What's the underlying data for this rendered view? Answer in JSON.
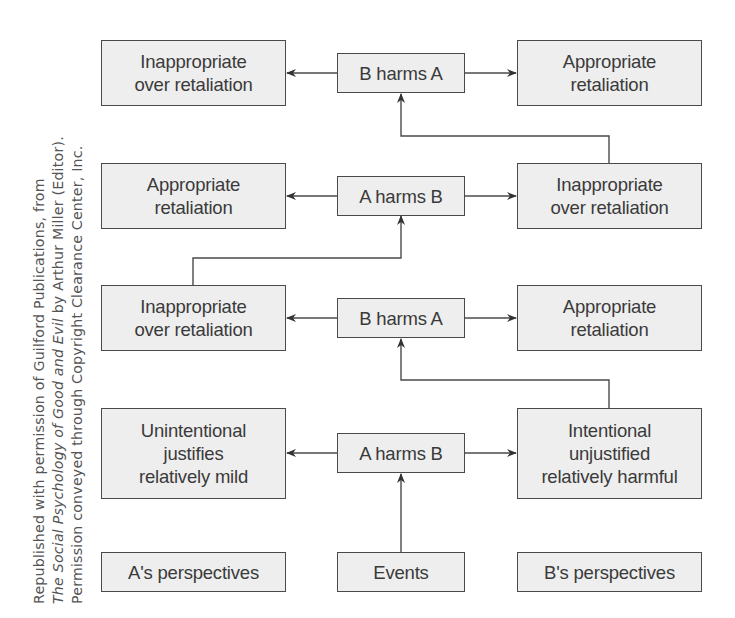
{
  "credit": {
    "line1": "Republished with permission of Guilford Publications, from",
    "line2_italic": "The Social Psychology of Good and Evil",
    "line2_rest": " by Arthur Miller (Editor).",
    "line3": "Permission conveyed through Copyright Clearance Center, Inc."
  },
  "rows": [
    {
      "left": "Inappropriate\nover retaliation",
      "center": "B harms A",
      "right": "Appropriate\nretaliation"
    },
    {
      "left": "Appropriate\nretaliation",
      "center": "A harms B",
      "right": "Inappropriate\nover retaliation"
    },
    {
      "left": "Inappropriate\nover retaliation",
      "center": "B harms A",
      "right": "Appropriate\nretaliation"
    },
    {
      "left": "Unintentional\njustifies\nrelatively mild",
      "center": "A harms B",
      "right": "Intentional\nunjustified\nrelatively harmful"
    },
    {
      "left": "A's perspectives",
      "center": "Events",
      "right": "B's perspectives"
    }
  ],
  "colors": {
    "box_fill": "#eeeeee",
    "line": "#4a4a4a",
    "text": "#3a3a3a"
  }
}
